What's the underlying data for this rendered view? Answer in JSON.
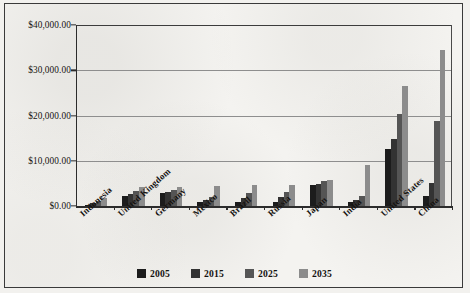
{
  "chart_data": {
    "type": "bar",
    "title": "",
    "xlabel": "",
    "ylabel": "",
    "ylim": [
      0,
      40000
    ],
    "ytick_values": [
      0,
      10000,
      20000,
      30000,
      40000
    ],
    "ytick_labels": [
      "$0.00",
      "$10,000.00",
      "$20,000.00",
      "$30,000.00",
      "$40,000.00"
    ],
    "grid": true,
    "legend_position": "bottom",
    "categories": [
      "Indonesia",
      "United Kingdom",
      "Germany",
      "Mexico",
      "Brazil",
      "Russia",
      "Japan",
      "India",
      "United States",
      "China"
    ],
    "series": [
      {
        "name": "2005",
        "color": "#1c1c1c",
        "values": [
          300,
          2200,
          2800,
          850,
          900,
          800,
          4550,
          800,
          12600,
          2300
        ]
      },
      {
        "name": "2015",
        "color": "#333333",
        "values": [
          700,
          2700,
          3000,
          1400,
          1700,
          2100,
          4900,
          1250,
          14900,
          5000
        ]
      },
      {
        "name": "2025",
        "color": "#555555",
        "values": [
          1100,
          3300,
          3600,
          2000,
          2800,
          3200,
          5500,
          2200,
          20400,
          18700
        ]
      },
      {
        "name": "2035",
        "color": "#8c8c8c",
        "values": [
          1800,
          4100,
          4100,
          4400,
          4600,
          4700,
          5800,
          9100,
          26500,
          34500
        ]
      }
    ]
  },
  "legend": {
    "items": [
      {
        "label": "2005",
        "color": "#1c1c1c"
      },
      {
        "label": "2015",
        "color": "#333333"
      },
      {
        "label": "2025",
        "color": "#555555"
      },
      {
        "label": "2035",
        "color": "#8c8c8c"
      }
    ]
  }
}
